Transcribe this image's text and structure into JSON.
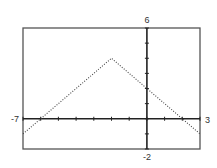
{
  "chart_data": {
    "type": "line",
    "title": "",
    "function": "y = -|x + 2| + 4",
    "xlabel": "",
    "ylabel": "",
    "xlim": [
      -7,
      3
    ],
    "ylim": [
      -2,
      6
    ],
    "xscale": 1,
    "yscale": 1,
    "grid": false,
    "legend": null,
    "tick_labels": {
      "xmin": "-7",
      "xmax": "3",
      "ymin": "-2",
      "ymax": "6"
    },
    "series": [
      {
        "name": "y = -|x+2| + 4",
        "style": "dotted",
        "x": [
          -7,
          -6,
          -5,
          -4,
          -3,
          -2,
          -1,
          0,
          1,
          2,
          3
        ],
        "y": [
          -1,
          0,
          1,
          2,
          3,
          4,
          3,
          2,
          1,
          0,
          -1
        ]
      }
    ],
    "key_points": {
      "vertex": [
        -2,
        4
      ],
      "y_intercept": [
        0,
        2
      ],
      "x_intercepts": [
        [
          -6,
          0
        ],
        [
          2,
          0
        ]
      ]
    }
  },
  "layout": {
    "frame": {
      "left": 23,
      "top": 28,
      "right": 200,
      "bottom": 149
    },
    "colors": {
      "frame": "#555555",
      "axis": "#222222",
      "curve": "#444444",
      "label": "#333333"
    }
  }
}
